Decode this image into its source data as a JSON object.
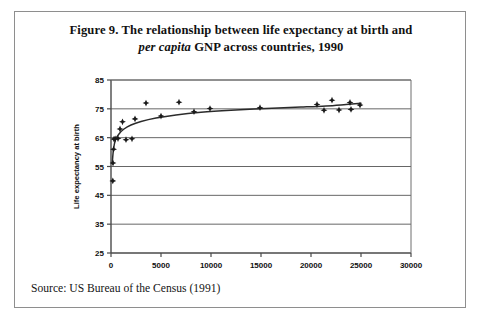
{
  "figure": {
    "caption_line1": "Figure 9. The relationship between life expectancy at birth and",
    "caption_line2_italic": "per capita",
    "caption_line2_rest": " GNP across countries, 1990",
    "source": "Source: US Bureau of the Census (1991)",
    "border_color": "#8e8e8e"
  },
  "chart_data": {
    "type": "scatter",
    "title": "Figure 9. The relationship between life expectancy at birth and per capita GNP across countries, 1990",
    "xlabel": "Country per capita GNP (1990 US $)",
    "xlabel_italic_part": "per capita",
    "ylabel": "Life expectancy at birth",
    "xlim": [
      0,
      30000
    ],
    "ylim": [
      25,
      85
    ],
    "xticks": [
      0,
      5000,
      10000,
      15000,
      20000,
      25000,
      30000
    ],
    "yticks": [
      25,
      35,
      45,
      55,
      65,
      75,
      85
    ],
    "grid": "horizontal",
    "legend": "none",
    "marker": "diamond-plus",
    "marker_color": "#1a1a1a",
    "series": [
      {
        "name": "Countries",
        "points": [
          [
            180,
            50.0
          ],
          [
            200,
            56.2
          ],
          [
            260,
            61.0
          ],
          [
            300,
            64.5
          ],
          [
            420,
            64.6
          ],
          [
            700,
            64.7
          ],
          [
            900,
            68.0
          ],
          [
            1150,
            70.5
          ],
          [
            1500,
            64.3
          ],
          [
            2100,
            64.6
          ],
          [
            2400,
            71.5
          ],
          [
            3500,
            77.0
          ],
          [
            5000,
            72.5
          ],
          [
            6800,
            77.3
          ],
          [
            8300,
            74.0
          ],
          [
            9900,
            75.1
          ],
          [
            14900,
            75.4
          ],
          [
            20600,
            76.5
          ],
          [
            21300,
            74.5
          ],
          [
            22100,
            78.0
          ],
          [
            22800,
            74.6
          ],
          [
            23900,
            77.2
          ],
          [
            24000,
            74.8
          ],
          [
            24900,
            76.3
          ]
        ]
      }
    ],
    "fit_curve": {
      "name": "Logarithmic trend",
      "description": "Smooth rising log-shaped curve through the scatter",
      "points": [
        [
          120,
          56.0
        ],
        [
          250,
          61.0
        ],
        [
          450,
          64.3
        ],
        [
          800,
          66.3
        ],
        [
          1300,
          68.0
        ],
        [
          2000,
          69.4
        ],
        [
          3000,
          70.6
        ],
        [
          4500,
          71.8
        ],
        [
          6500,
          72.9
        ],
        [
          9000,
          73.8
        ],
        [
          12000,
          74.5
        ],
        [
          15500,
          75.1
        ],
        [
          19000,
          75.6
        ],
        [
          21500,
          76.0
        ],
        [
          23500,
          76.5
        ],
        [
          25000,
          76.9
        ]
      ]
    }
  }
}
